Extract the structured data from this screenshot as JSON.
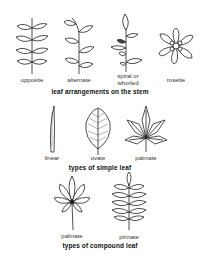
{
  "sections": [
    {
      "caption": "leaf arrangements on the stem",
      "items": [
        {
          "label": "opposite",
          "icon": "opposite-leaf-arrangement"
        },
        {
          "label": "alternate",
          "icon": "alternate-leaf-arrangement"
        },
        {
          "label_line1": "spiral or",
          "label_line2": "whorled",
          "icon": "spiral-leaf-arrangement"
        },
        {
          "label": "rosette",
          "icon": "rosette-leaf-arrangement"
        }
      ]
    },
    {
      "caption": "types of simple leaf",
      "items": [
        {
          "label": "linear",
          "icon": "linear-leaf"
        },
        {
          "label": "ovate",
          "icon": "ovate-leaf"
        },
        {
          "label": "palmate",
          "icon": "palmate-simple-leaf"
        }
      ]
    },
    {
      "caption": "types of compound leaf",
      "items": [
        {
          "label": "palmate",
          "icon": "palmate-compound-leaf"
        },
        {
          "label": "pinnate",
          "icon": "pinnate-compound-leaf"
        }
      ]
    }
  ]
}
